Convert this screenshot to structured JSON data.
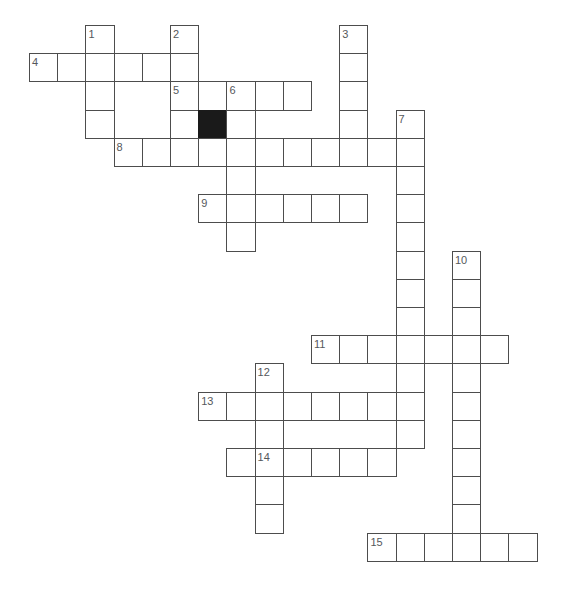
{
  "puzzle": {
    "type": "crossword-grid",
    "title": "Crossword puzzle grid",
    "width": 565,
    "height": 605,
    "cell_size": 28.2,
    "origin_x": 29,
    "origin_y": 25,
    "colors": {
      "background": "#ffffff",
      "cell_fill": "#ffffff",
      "cell_border": "#4d4d4d",
      "block_fill": "#1a1a1a",
      "number_text": "#55585c"
    },
    "counts": {
      "clue_numbers": 15,
      "white_cells": 112,
      "block_cells": 1
    },
    "cells": [
      {
        "c": 2,
        "r": 0
      },
      {
        "c": 5,
        "r": 0
      },
      {
        "c": 11,
        "r": 0
      },
      {
        "c": 0,
        "r": 1
      },
      {
        "c": 1,
        "r": 1
      },
      {
        "c": 2,
        "r": 1
      },
      {
        "c": 3,
        "r": 1
      },
      {
        "c": 4,
        "r": 1
      },
      {
        "c": 5,
        "r": 1
      },
      {
        "c": 11,
        "r": 1
      },
      {
        "c": 2,
        "r": 2
      },
      {
        "c": 5,
        "r": 2
      },
      {
        "c": 6,
        "r": 2
      },
      {
        "c": 7,
        "r": 2
      },
      {
        "c": 8,
        "r": 2
      },
      {
        "c": 9,
        "r": 2
      },
      {
        "c": 11,
        "r": 2
      },
      {
        "c": 2,
        "r": 3
      },
      {
        "c": 5,
        "r": 3
      },
      {
        "c": 6,
        "r": 3
      },
      {
        "c": 7,
        "r": 3
      },
      {
        "c": 11,
        "r": 3
      },
      {
        "c": 13,
        "r": 3
      },
      {
        "c": 3,
        "r": 4
      },
      {
        "c": 4,
        "r": 4
      },
      {
        "c": 5,
        "r": 4
      },
      {
        "c": 6,
        "r": 4
      },
      {
        "c": 7,
        "r": 4
      },
      {
        "c": 8,
        "r": 4
      },
      {
        "c": 9,
        "r": 4
      },
      {
        "c": 10,
        "r": 4
      },
      {
        "c": 11,
        "r": 4
      },
      {
        "c": 12,
        "r": 4
      },
      {
        "c": 13,
        "r": 4
      },
      {
        "c": 7,
        "r": 5
      },
      {
        "c": 13,
        "r": 5
      },
      {
        "c": 6,
        "r": 6
      },
      {
        "c": 7,
        "r": 6
      },
      {
        "c": 8,
        "r": 6
      },
      {
        "c": 9,
        "r": 6
      },
      {
        "c": 10,
        "r": 6
      },
      {
        "c": 11,
        "r": 6
      },
      {
        "c": 13,
        "r": 6
      },
      {
        "c": 7,
        "r": 7
      },
      {
        "c": 13,
        "r": 7
      },
      {
        "c": 13,
        "r": 8
      },
      {
        "c": 15,
        "r": 8
      },
      {
        "c": 13,
        "r": 9
      },
      {
        "c": 15,
        "r": 9
      },
      {
        "c": 13,
        "r": 10
      },
      {
        "c": 15,
        "r": 10
      },
      {
        "c": 10,
        "r": 11
      },
      {
        "c": 11,
        "r": 11
      },
      {
        "c": 12,
        "r": 11
      },
      {
        "c": 13,
        "r": 11
      },
      {
        "c": 14,
        "r": 11
      },
      {
        "c": 15,
        "r": 11
      },
      {
        "c": 16,
        "r": 11
      },
      {
        "c": 8,
        "r": 12
      },
      {
        "c": 13,
        "r": 12
      },
      {
        "c": 15,
        "r": 12
      },
      {
        "c": 6,
        "r": 13
      },
      {
        "c": 7,
        "r": 13
      },
      {
        "c": 8,
        "r": 13
      },
      {
        "c": 9,
        "r": 13
      },
      {
        "c": 10,
        "r": 13
      },
      {
        "c": 11,
        "r": 13
      },
      {
        "c": 12,
        "r": 13
      },
      {
        "c": 13,
        "r": 13
      },
      {
        "c": 15,
        "r": 13
      },
      {
        "c": 8,
        "r": 14
      },
      {
        "c": 13,
        "r": 14
      },
      {
        "c": 15,
        "r": 14
      },
      {
        "c": 7,
        "r": 15
      },
      {
        "c": 8,
        "r": 15
      },
      {
        "c": 9,
        "r": 15
      },
      {
        "c": 10,
        "r": 15
      },
      {
        "c": 11,
        "r": 15
      },
      {
        "c": 12,
        "r": 15
      },
      {
        "c": 15,
        "r": 15
      },
      {
        "c": 8,
        "r": 16
      },
      {
        "c": 15,
        "r": 16
      },
      {
        "c": 8,
        "r": 17
      },
      {
        "c": 15,
        "r": 17
      },
      {
        "c": 12,
        "r": 18
      },
      {
        "c": 13,
        "r": 18
      },
      {
        "c": 14,
        "r": 18
      },
      {
        "c": 15,
        "r": 18
      },
      {
        "c": 16,
        "r": 18
      },
      {
        "c": 17,
        "r": 18
      }
    ],
    "blocks": [
      {
        "c": 6,
        "r": 3
      }
    ],
    "numbers": [
      {
        "n": "1",
        "c": 2,
        "r": 0
      },
      {
        "n": "2",
        "c": 5,
        "r": 0
      },
      {
        "n": "3",
        "c": 11,
        "r": 0
      },
      {
        "n": "4",
        "c": 0,
        "r": 1
      },
      {
        "n": "5",
        "c": 5,
        "r": 2
      },
      {
        "n": "6",
        "c": 7,
        "r": 2
      },
      {
        "n": "7",
        "c": 13,
        "r": 3
      },
      {
        "n": "8",
        "c": 3,
        "r": 4
      },
      {
        "n": "9",
        "c": 6,
        "r": 6
      },
      {
        "n": "10",
        "c": 15,
        "r": 8
      },
      {
        "n": "11",
        "c": 10,
        "r": 11
      },
      {
        "n": "12",
        "c": 8,
        "r": 12
      },
      {
        "n": "13",
        "c": 6,
        "r": 13
      },
      {
        "n": "14",
        "c": 8,
        "r": 15
      },
      {
        "n": "15",
        "c": 12,
        "r": 18
      }
    ]
  }
}
